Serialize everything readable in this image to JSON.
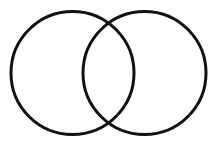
{
  "figure": {
    "type": "venn-diagram",
    "title": "",
    "caption": "",
    "width": 217,
    "height": 142,
    "background_color": "#ffffff",
    "stroke_color": "#111111",
    "stroke_width": 3,
    "fill": "none",
    "set_count": 2,
    "labels": {
      "left_set": "",
      "right_set": "",
      "intersection": ""
    },
    "circles": [
      {
        "id": "left-circle",
        "name": "left-set-circle",
        "cx": 72.5,
        "cy": 73,
        "r": 61.5,
        "stroke": "#111111",
        "stroke_width": 3,
        "fill": "none",
        "label": ""
      },
      {
        "id": "right-circle",
        "name": "right-set-circle",
        "cx": 144.5,
        "cy": 73,
        "r": 61.5,
        "stroke": "#111111",
        "stroke_width": 3,
        "fill": "none",
        "label": ""
      }
    ],
    "intersection_points": [
      {
        "x": 108.5,
        "y": 23
      },
      {
        "x": 108.5,
        "y": 123
      }
    ]
  }
}
